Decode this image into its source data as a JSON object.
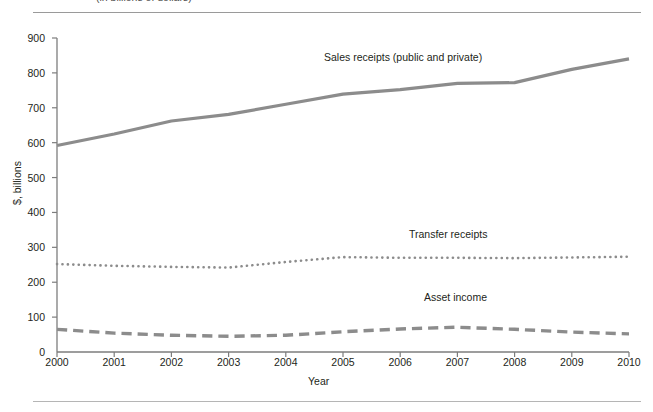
{
  "figure": {
    "clipped_caption": "(in billions of dollars)",
    "divider_color": "#9a9a9a"
  },
  "chart_data": {
    "type": "line",
    "title": "",
    "xlabel": "Year",
    "ylabel": "$, billions",
    "x": [
      2000,
      2001,
      2002,
      2003,
      2004,
      2005,
      2006,
      2007,
      2008,
      2009,
      2010
    ],
    "categories": [
      "2000",
      "2001",
      "2002",
      "2003",
      "2004",
      "2005",
      "2006",
      "2007",
      "2008",
      "2009",
      "2010"
    ],
    "xlim": [
      2000,
      2010
    ],
    "ylim": [
      0,
      900
    ],
    "yticks": [
      0,
      100,
      200,
      300,
      400,
      500,
      600,
      700,
      800,
      900
    ],
    "ytick_labels": [
      "0",
      "100",
      "200",
      "300",
      "400",
      "500",
      "600",
      "700",
      "800",
      "900"
    ],
    "grid": false,
    "legend": "inline-annotations",
    "series": [
      {
        "name": "Sales receipts (public and private)",
        "style": "solid",
        "color": "#8c8c8c",
        "values": [
          592,
          625,
          662,
          681,
          710,
          739,
          752,
          770,
          772,
          810,
          840
        ]
      },
      {
        "name": "Transfer receipts",
        "style": "dotted",
        "color": "#8c8c8c",
        "values": [
          252,
          247,
          244,
          242,
          258,
          272,
          270,
          270,
          269,
          271,
          273
        ]
      },
      {
        "name": "Asset income",
        "style": "dashed",
        "color": "#8c8c8c",
        "values": [
          65,
          54,
          48,
          45,
          48,
          58,
          66,
          71,
          65,
          57,
          52
        ]
      }
    ],
    "annotations": [
      {
        "text": "Sales receipts (public and private)",
        "x": 2005.2,
        "y": 860
      },
      {
        "text": "Transfer receipts",
        "x": 2006.6,
        "y": 340
      },
      {
        "text": "Asset income",
        "x": 2006.9,
        "y": 160
      }
    ]
  }
}
